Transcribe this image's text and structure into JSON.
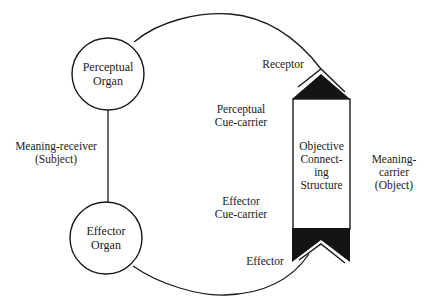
{
  "diagram": {
    "type": "functional-circle",
    "nodes": {
      "perceptual_organ": {
        "line1": "Perceptual",
        "line2": "Organ"
      },
      "effector_organ": {
        "line1": "Effector",
        "line2": "Organ"
      },
      "objective_structure": {
        "line1": "Objective",
        "line2": "Connect-",
        "line3": "ing",
        "line4": "Structure"
      }
    },
    "labels": {
      "meaning_receiver": {
        "line1": "Meaning-receiver",
        "line2": "(Subject)"
      },
      "meaning_carrier": {
        "line1": "Meaning-",
        "line2": "carrier",
        "line3": "(Object)"
      },
      "receptor": "Receptor",
      "effector": "Effector",
      "perceptual_cue_carrier": {
        "line1": "Perceptual",
        "line2": "Cue-carrier"
      },
      "effector_cue_carrier": {
        "line1": "Effector",
        "line2": "Cue-carrier"
      }
    },
    "colors": {
      "stroke": "#1a1a1a",
      "fill_dark": "#141414",
      "background": "#ffffff"
    }
  }
}
